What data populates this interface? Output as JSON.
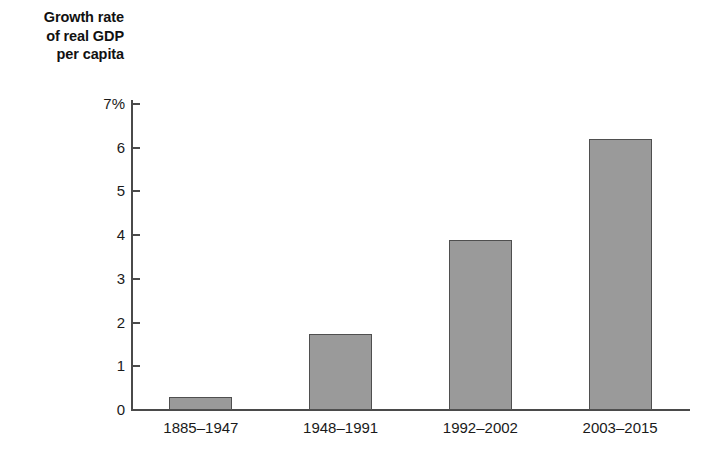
{
  "chart_data": {
    "type": "bar",
    "title": "Growth rate of real GDP per capita",
    "title_lines": [
      "Growth rate",
      "of real GDP",
      "per capita"
    ],
    "xlabel": "",
    "ylabel": "Growth rate of real GDP per capita",
    "categories": [
      "1885–1947",
      "1948–1991",
      "1992–2002",
      "2003–2015"
    ],
    "values": [
      0.3,
      1.75,
      3.9,
      6.2
    ],
    "ylim": [
      0,
      7
    ],
    "yticks": [
      0,
      1,
      2,
      3,
      4,
      5,
      6,
      7
    ],
    "ytick_labels": [
      "0",
      "1",
      "2",
      "3",
      "4",
      "5",
      "6",
      "7%"
    ],
    "grid": false,
    "legend": false,
    "bar_color": "#9a9a9a",
    "bar_edge_color": "#4f4f4f",
    "axis_color": "#4a4a4a",
    "background_color": "#ffffff"
  }
}
